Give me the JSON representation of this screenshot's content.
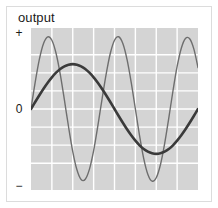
{
  "figure": {
    "axis_title": "output",
    "background": "#ffffff",
    "frame_color": "#dcdcdc"
  },
  "axis": {
    "y_ticks": [
      {
        "name": "positive",
        "label": "+",
        "value": 1
      },
      {
        "name": "zero",
        "label": "0",
        "value": 0
      },
      {
        "name": "negative",
        "label": "−",
        "value": -1
      }
    ]
  },
  "chart_data": {
    "type": "line",
    "title": "output",
    "xlabel": "",
    "ylabel": "output",
    "ylim": [
      -1.12,
      1.12
    ],
    "xlim": [
      0,
      1
    ],
    "grid": true,
    "grid_color": "#ffffff",
    "plot_background": "#d4d4d4",
    "legend": "none",
    "x_gridlines": [
      0.125,
      0.25,
      0.375,
      0.5,
      0.625,
      0.75,
      0.875
    ],
    "y_gridlines": [
      -0.75,
      -0.5,
      -0.25,
      0,
      0.25,
      0.5,
      0.75
    ],
    "series": [
      {
        "name": "high-frequency-wave",
        "style": "thin",
        "color": "#6e6e6e",
        "width": 1.4,
        "amplitude": 1.0,
        "cycles": 2.4,
        "phase": 0,
        "description": "thin gray sine, 2.4 cycles, full amplitude",
        "x": [
          0.0,
          0.025,
          0.05,
          0.075,
          0.1,
          0.125,
          0.15,
          0.175,
          0.2,
          0.225,
          0.25,
          0.275,
          0.3,
          0.325,
          0.35,
          0.375,
          0.4,
          0.425,
          0.45,
          0.475,
          0.5,
          0.525,
          0.55,
          0.575,
          0.6,
          0.625,
          0.65,
          0.675,
          0.7,
          0.725,
          0.75,
          0.775,
          0.8,
          0.825,
          0.85,
          0.875,
          0.9,
          0.925,
          0.95,
          0.975,
          1.0
        ],
        "values": [
          0.0,
          0.368,
          0.685,
          0.905,
          0.998,
          0.951,
          0.771,
          0.482,
          0.125,
          -0.249,
          -0.588,
          -0.841,
          -0.975,
          -0.971,
          -0.831,
          -0.574,
          -0.236,
          0.131,
          0.482,
          0.771,
          0.951,
          0.999,
          0.905,
          0.685,
          0.368,
          0.0,
          -0.368,
          -0.685,
          -0.905,
          -0.998,
          -0.951,
          -0.771,
          -0.482,
          -0.125,
          0.249,
          0.588,
          0.841,
          0.975,
          0.971,
          0.831,
          0.574
        ]
      },
      {
        "name": "low-frequency-wave",
        "style": "thick",
        "color": "#3a3a3a",
        "width": 2.6,
        "amplitude": 0.62,
        "cycles": 1.0,
        "phase": 0,
        "description": "thick dark sine, 1 cycle, reduced amplitude",
        "x": [
          0.0,
          0.025,
          0.05,
          0.075,
          0.1,
          0.125,
          0.15,
          0.175,
          0.2,
          0.225,
          0.25,
          0.275,
          0.3,
          0.325,
          0.35,
          0.375,
          0.4,
          0.425,
          0.45,
          0.475,
          0.5,
          0.525,
          0.55,
          0.575,
          0.6,
          0.625,
          0.65,
          0.675,
          0.7,
          0.725,
          0.75,
          0.775,
          0.8,
          0.825,
          0.85,
          0.875,
          0.9,
          0.925,
          0.95,
          0.975,
          1.0
        ],
        "values": [
          0.0,
          0.097,
          0.191,
          0.281,
          0.364,
          0.438,
          0.502,
          0.554,
          0.59,
          0.612,
          0.62,
          0.612,
          0.59,
          0.554,
          0.502,
          0.438,
          0.364,
          0.281,
          0.191,
          0.097,
          0.0,
          -0.097,
          -0.191,
          -0.281,
          -0.364,
          -0.438,
          -0.502,
          -0.554,
          -0.59,
          -0.612,
          -0.62,
          -0.612,
          -0.59,
          -0.554,
          -0.502,
          -0.438,
          -0.364,
          -0.281,
          -0.191,
          -0.097,
          0.0
        ]
      }
    ]
  }
}
